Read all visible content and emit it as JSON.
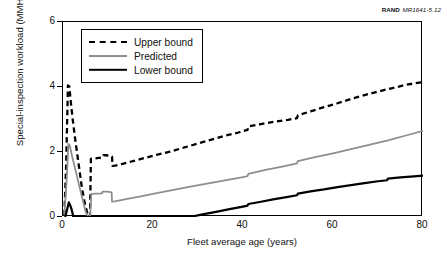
{
  "figure": {
    "source_credit_publisher": "RAND",
    "source_credit_docid": "MR1641-5.12"
  },
  "legend": {
    "position": "top-left inside plot",
    "items": [
      {
        "label": "Upper bound",
        "style": "dashed",
        "color": "#000000",
        "swatch": "dashed-line-swatch"
      },
      {
        "label": "Predicted",
        "style": "solid",
        "color": "#8e8e8e",
        "swatch": "gray-line-swatch"
      },
      {
        "label": "Lower bound",
        "style": "solid",
        "color": "#000000",
        "swatch": "black-line-swatch"
      }
    ]
  },
  "axes": {
    "x_ticks": [
      "0",
      "20",
      "40",
      "60",
      "80"
    ],
    "y_ticks": [
      "0",
      "2",
      "4",
      "6"
    ]
  },
  "chart_data": {
    "type": "line",
    "title": "",
    "subtitle": "",
    "xlabel": "Fleet average age (years)",
    "ylabel": "Special-inspection workload (MMH/FH)",
    "xlim": [
      0,
      80
    ],
    "ylim": [
      0,
      6
    ],
    "xticks": [
      0,
      20,
      40,
      60,
      80
    ],
    "yticks": [
      0,
      2,
      4,
      6
    ],
    "grid": false,
    "legend_position": "upper left",
    "annotations": [
      {
        "text": "RAND MR1641-5.12",
        "position": "top-right outside plot"
      }
    ],
    "series": [
      {
        "name": "Upper bound",
        "color": "#000000",
        "style": "dashed",
        "x": [
          0.3,
          0.7,
          1.1,
          1.4,
          1.8,
          2.2,
          2.7,
          3.2,
          3.7,
          4.2,
          4.8,
          5.4,
          5.9,
          6.0,
          6.2,
          7.0,
          8.0,
          8.9,
          9.0,
          9.6,
          10.4,
          10.9,
          11.0,
          11.6,
          13,
          15,
          18,
          21,
          24,
          27,
          30,
          33,
          36,
          39,
          41,
          41.2,
          44,
          47,
          50,
          52,
          52.2,
          55,
          58,
          61,
          64,
          67,
          70,
          73,
          76,
          78,
          80
        ],
        "y": [
          0.05,
          1.6,
          4.05,
          4.02,
          3.45,
          2.95,
          2.4,
          1.9,
          1.4,
          0.9,
          0.45,
          0.12,
          0.0,
          0.0,
          1.79,
          1.8,
          1.82,
          1.84,
          1.9,
          1.9,
          1.88,
          1.86,
          1.57,
          1.58,
          1.63,
          1.7,
          1.81,
          1.92,
          2.02,
          2.14,
          2.26,
          2.38,
          2.5,
          2.6,
          2.68,
          2.79,
          2.86,
          2.93,
          2.99,
          3.04,
          3.13,
          3.25,
          3.38,
          3.5,
          3.63,
          3.75,
          3.86,
          3.96,
          4.06,
          4.11,
          4.15
        ]
      },
      {
        "name": "Predicted",
        "color": "#8e8e8e",
        "style": "solid",
        "x": [
          0.3,
          0.8,
          1.2,
          1.5,
          2.0,
          2.5,
          3.0,
          3.5,
          4.0,
          4.5,
          5.0,
          5.4,
          5.9,
          6.0,
          6.3,
          7.5,
          8.7,
          8.8,
          9.5,
          10.3,
          10.8,
          10.9,
          11.5,
          14,
          17,
          20,
          24,
          28,
          32,
          36,
          40,
          41,
          41.2,
          45,
          49,
          52,
          52.2,
          56,
          60,
          64,
          68,
          72,
          76,
          80
        ],
        "y": [
          0.05,
          1.1,
          2.25,
          2.2,
          1.88,
          1.6,
          1.32,
          1.02,
          0.74,
          0.46,
          0.18,
          0.04,
          0.0,
          0.0,
          0.71,
          0.72,
          0.73,
          0.78,
          0.78,
          0.77,
          0.76,
          0.47,
          0.48,
          0.55,
          0.63,
          0.71,
          0.82,
          0.93,
          1.03,
          1.13,
          1.23,
          1.26,
          1.33,
          1.45,
          1.56,
          1.65,
          1.72,
          1.84,
          1.96,
          2.09,
          2.22,
          2.35,
          2.5,
          2.65
        ]
      },
      {
        "name": "Lower bound",
        "color": "#000000",
        "style": "solid",
        "x": [
          0.5,
          0.9,
          1.3,
          1.6,
          1.9,
          2.1,
          2.3,
          28.2,
          31,
          34,
          37,
          40,
          41,
          41.2,
          44,
          47,
          50,
          52,
          52.2,
          55,
          58,
          61,
          64,
          67,
          70,
          72,
          72.2,
          75,
          78,
          80
        ],
        "y": [
          0.0,
          0.22,
          0.45,
          0.36,
          0.24,
          0.12,
          0.0,
          0.0,
          0.08,
          0.16,
          0.24,
          0.32,
          0.35,
          0.4,
          0.47,
          0.55,
          0.62,
          0.67,
          0.72,
          0.79,
          0.85,
          0.92,
          0.98,
          1.04,
          1.1,
          1.13,
          1.18,
          1.22,
          1.25,
          1.27
        ]
      }
    ]
  }
}
